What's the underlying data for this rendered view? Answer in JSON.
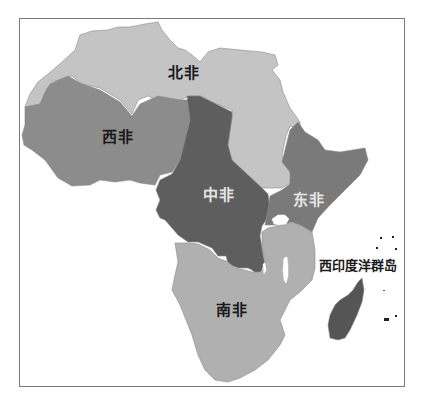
{
  "map": {
    "title": "",
    "subject": "Africa regions",
    "regions": [
      {
        "id": "north",
        "label": "北非",
        "fill": "#c4c4c4",
        "label_color": "#1a1a1a"
      },
      {
        "id": "west",
        "label": "西非",
        "fill": "#8c8c8c",
        "label_color": "#1a1a1a"
      },
      {
        "id": "central",
        "label": "中非",
        "fill": "#5e5e5e",
        "label_color": "#e6e6e6"
      },
      {
        "id": "east",
        "label": "东非",
        "fill": "#7a7a7a",
        "label_color": "#e6e6e6"
      },
      {
        "id": "south",
        "label": "南非",
        "fill": "#b0b0b0",
        "label_color": "#1a1a1a"
      },
      {
        "id": "indian_ocean_islands",
        "label": "西印度洋群岛",
        "fill": "#555555",
        "label_color": "#1a1a1a"
      }
    ],
    "colors": {
      "background": "#ffffff",
      "frame": "#7a7a7a",
      "water": "#ffffff",
      "border_lines": "#8a8a8a"
    }
  }
}
